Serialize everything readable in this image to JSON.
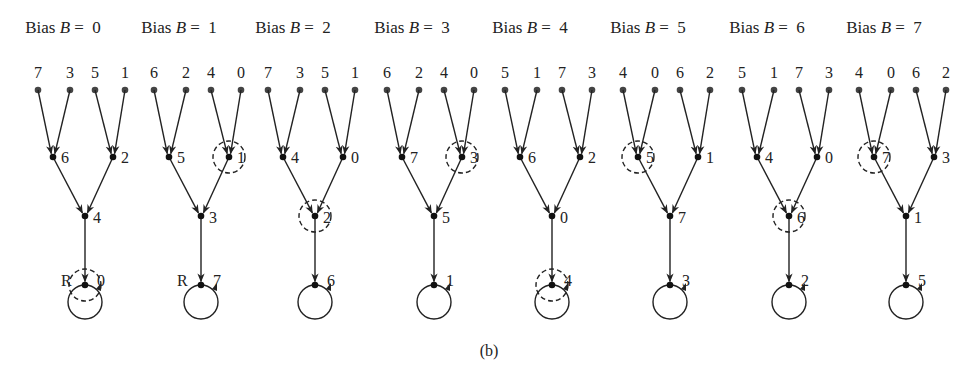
{
  "caption": "(b)",
  "colors": {
    "ink": "#222222",
    "leaf": "#444444",
    "background": "#ffffff"
  },
  "trees": [
    {
      "title_prefix": "Bias ",
      "title_var": "B",
      "title_suffix": " = 0",
      "leaves": [
        "7",
        "3",
        "5",
        "1"
      ],
      "level1": [
        "6",
        "2"
      ],
      "level2": "4",
      "root": "0",
      "root_marker": "R",
      "dashed": "root",
      "x": 38
    },
    {
      "title_prefix": "Bias ",
      "title_var": "B",
      "title_suffix": " = 1",
      "leaves": [
        "6",
        "2",
        "4",
        "0"
      ],
      "level1": [
        "5",
        "1"
      ],
      "level2": "3",
      "root": "7",
      "root_marker": "R",
      "dashed": "level1_right",
      "x": 154
    },
    {
      "title_prefix": "Bias ",
      "title_var": "B",
      "title_suffix": " = 2",
      "leaves": [
        "7",
        "3",
        "5",
        "1"
      ],
      "level1": [
        "4",
        "0"
      ],
      "level2": "2",
      "root": "6",
      "root_marker": "",
      "dashed": "level2",
      "x": 268
    },
    {
      "title_prefix": "Bias ",
      "title_var": "B",
      "title_suffix": " = 3",
      "leaves": [
        "6",
        "2",
        "4",
        "0"
      ],
      "level1": [
        "7",
        "3"
      ],
      "level2": "5",
      "root": "1",
      "root_marker": "",
      "dashed": "level1_right",
      "x": 387
    },
    {
      "title_prefix": "Bias ",
      "title_var": "B",
      "title_suffix": " = 4",
      "leaves": [
        "5",
        "1",
        "7",
        "3"
      ],
      "level1": [
        "6",
        "2"
      ],
      "level2": "0",
      "root": "4",
      "root_marker": "",
      "dashed": "root",
      "x": 505
    },
    {
      "title_prefix": "Bias ",
      "title_var": "B",
      "title_suffix": " = 5",
      "leaves": [
        "4",
        "0",
        "6",
        "2"
      ],
      "level1": [
        "5",
        "1"
      ],
      "level2": "7",
      "root": "3",
      "root_marker": "",
      "dashed": "level1_left",
      "x": 623
    },
    {
      "title_prefix": "Bias ",
      "title_var": "B",
      "title_suffix": " = 6",
      "leaves": [
        "5",
        "1",
        "7",
        "3"
      ],
      "level1": [
        "4",
        "0"
      ],
      "level2": "6",
      "root": "2",
      "root_marker": "",
      "dashed": "level2",
      "x": 742
    },
    {
      "title_prefix": "Bias ",
      "title_var": "B",
      "title_suffix": " = 7",
      "leaves": [
        "4",
        "0",
        "6",
        "2"
      ],
      "level1": [
        "7",
        "3"
      ],
      "level2": "1",
      "root": "5",
      "root_marker": "",
      "dashed": "level1_left",
      "x": 859
    }
  ]
}
